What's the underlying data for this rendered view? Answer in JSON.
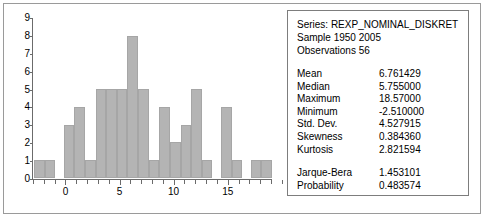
{
  "chart_data": {
    "type": "bar",
    "title": "",
    "xlabel": "",
    "ylabel": "",
    "ylim": [
      0,
      9
    ],
    "xlim": [
      -3,
      19
    ],
    "grid": false,
    "legend": "none",
    "bin_width": 1,
    "y_ticks": [
      "9",
      "8",
      "7",
      "6",
      "5",
      "4",
      "3",
      "2",
      "1",
      "0"
    ],
    "x_ticks": [
      "0",
      "5",
      "10",
      "15"
    ],
    "x_tick_values": [
      0,
      5,
      10,
      15
    ],
    "categories": [
      -3,
      -2,
      -1,
      0,
      1,
      2,
      3,
      4,
      5,
      6,
      7,
      8,
      9,
      10,
      11,
      12,
      13,
      14,
      15,
      16,
      17,
      18,
      19
    ],
    "values": [
      1,
      1,
      0,
      3,
      4,
      1,
      5,
      5,
      5,
      8,
      5,
      1,
      4,
      2,
      3,
      5,
      1,
      0,
      4,
      1,
      0,
      1,
      1
    ]
  },
  "stats_panel": {
    "series_line": "Series: REXP_NOMINAL_DISKRET",
    "sample_line": "Sample 1950 2005",
    "observations_line": "Observations 56",
    "rows": [
      {
        "name": "Mean",
        "value": "6.761429"
      },
      {
        "name": "Median",
        "value": "5.755000"
      },
      {
        "name": "Maximum",
        "value": "18.57000"
      },
      {
        "name": "Minimum",
        "value": "-2.510000"
      },
      {
        "name": "Std. Dev.",
        "value": "4.527915"
      },
      {
        "name": "Skewness",
        "value": "0.384360"
      },
      {
        "name": "Kurtosis",
        "value": "2.821594"
      }
    ],
    "test_rows": [
      {
        "name": "Jarque-Bera",
        "value": "1.453101"
      },
      {
        "name": "Probability",
        "value": "0.483574"
      }
    ]
  },
  "colors": {
    "bar_fill": "#b4b4b4",
    "bar_border": "#a6a6a6",
    "axis": "#6b6b6b",
    "frame": "#9a9a9a",
    "panel_border": "#7d7d7d",
    "text": "#000000",
    "background": "#ffffff"
  }
}
